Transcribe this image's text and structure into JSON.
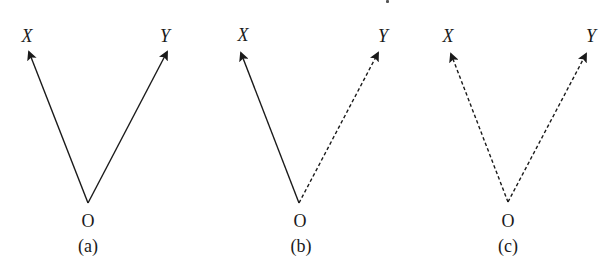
{
  "figure": {
    "panels": [
      {
        "id": "a",
        "caption": "(a)",
        "origin_label": "O",
        "vector_x": {
          "label": "X",
          "style": "solid"
        },
        "vector_y": {
          "label": "Y",
          "style": "solid"
        },
        "geometry": {
          "origin": [
            88,
            203
          ],
          "x_tip": [
            29,
            52
          ],
          "y_tip": [
            167,
            52
          ],
          "x_label_pos": [
            27,
            36
          ],
          "y_label_pos": [
            165,
            36
          ],
          "o_label_pos": [
            88,
            221
          ],
          "caption_pos": [
            88,
            246
          ]
        }
      },
      {
        "id": "b",
        "caption": "(b)",
        "origin_label": "O",
        "vector_x": {
          "label": "X",
          "style": "solid"
        },
        "vector_y": {
          "label": "Y",
          "style": "dashed"
        },
        "geometry": {
          "origin": [
            299,
            203
          ],
          "x_tip": [
            241,
            53
          ],
          "y_tip": [
            378,
            53
          ],
          "x_label_pos": [
            243,
            35
          ],
          "y_label_pos": [
            383,
            36
          ],
          "o_label_pos": [
            300,
            221
          ],
          "caption_pos": [
            301,
            246
          ]
        }
      },
      {
        "id": "c",
        "caption": "(c)",
        "origin_label": "O",
        "vector_x": {
          "label": "X",
          "style": "dashed"
        },
        "vector_y": {
          "label": "Y",
          "style": "dashed"
        },
        "geometry": {
          "origin": [
            508,
            202
          ],
          "x_tip": [
            451,
            54
          ],
          "y_tip": [
            586,
            54
          ],
          "x_label_pos": [
            448,
            36
          ],
          "y_label_pos": [
            591,
            36
          ],
          "o_label_pos": [
            508,
            221
          ],
          "caption_pos": [
            508,
            246
          ]
        }
      }
    ],
    "colors": {
      "stroke": "#1a1a1a",
      "background": "#ffffff"
    }
  }
}
